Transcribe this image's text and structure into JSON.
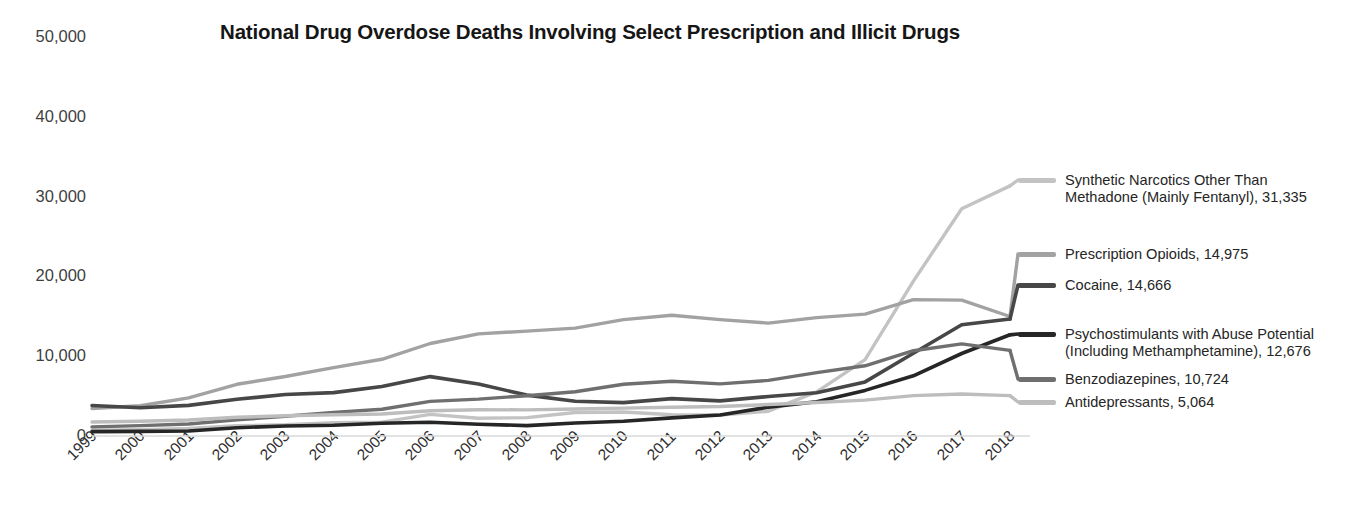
{
  "chart_data": {
    "type": "line",
    "title": "National Drug Overdose Deaths Involving Select Prescription and Illicit Drugs",
    "xlabel": "",
    "ylabel": "",
    "ylim": [
      0,
      50000
    ],
    "grid": false,
    "legend_position": "right",
    "categories": [
      "1999",
      "2000",
      "2001",
      "2002",
      "2003",
      "2004",
      "2005",
      "2006",
      "2007",
      "2008",
      "2009",
      "2010",
      "2011",
      "2012",
      "2013",
      "2014",
      "2015",
      "2016",
      "2017",
      "2018"
    ],
    "ytick_labels": [
      "50,000",
      "40,000",
      "30,000",
      "20,000",
      "10,000",
      "0"
    ],
    "ytick_values": [
      50000,
      40000,
      30000,
      20000,
      10000,
      0
    ],
    "series": [
      {
        "name": "Synthetic Narcotics Other Than Methadone (Mainly Fentanyl)",
        "legend_label": "Synthetic Narcotics Other Than\nMethadone (Mainly Fentanyl), 31,335",
        "final_value": "31,335",
        "color": "#c3c3c3",
        "width": 3.4,
        "values": [
          730,
          782,
          957,
          1295,
          1400,
          1664,
          1742,
          2707,
          2213,
          2306,
          2946,
          3007,
          2666,
          2628,
          3105,
          5544,
          9580,
          19413,
          28466,
          31335
        ]
      },
      {
        "name": "Prescription Opioids",
        "legend_label": "Prescription Opioids, 14,975",
        "final_value": "14,975",
        "color": "#a2a2a2",
        "width": 3.4,
        "values": [
          3442,
          3785,
          4770,
          6483,
          7456,
          8577,
          9612,
          11589,
          12796,
          13149,
          13523,
          14583,
          15140,
          14583,
          14145,
          14838,
          15281,
          17087,
          17029,
          14975
        ]
      },
      {
        "name": "Cocaine",
        "legend_label": "Cocaine, 14,666",
        "final_value": "14,666",
        "color": "#474747",
        "width": 3.6,
        "values": [
          3822,
          3544,
          3833,
          4599,
          5196,
          5443,
          6208,
          7448,
          6512,
          5129,
          4350,
          4183,
          4681,
          4404,
          4944,
          5415,
          6784,
          10375,
          13942,
          14666
        ]
      },
      {
        "name": "Psychostimulants with Abuse Potential (Including Methamphetamine)",
        "legend_label": "Psychostimulants with Abuse Potential\n(Including Methamphetamine), 12,676",
        "final_value": "12,676",
        "color": "#262626",
        "width": 3.6,
        "values": [
          547,
          573,
          626,
          1044,
          1250,
          1335,
          1608,
          1711,
          1476,
          1304,
          1632,
          1854,
          2266,
          2635,
          3627,
          4298,
          5716,
          7542,
          10333,
          12676
        ]
      },
      {
        "name": "Benzodiazepines",
        "legend_label": "Benzodiazepines, 10,724",
        "final_value": "10,724",
        "color": "#6f6f6f",
        "width": 3.4,
        "values": [
          1135,
          1298,
          1505,
          2021,
          2465,
          2963,
          3346,
          4342,
          4620,
          5045,
          5548,
          6497,
          6872,
          6524,
          6973,
          7945,
          8791,
          10684,
          11537,
          10724
        ]
      },
      {
        "name": "Antidepressants",
        "legend_label": "Antidepressants, 5,064",
        "final_value": "5,064",
        "color": "#bdbdbd",
        "width": 3.4,
        "values": [
          1749,
          1850,
          2003,
          2345,
          2536,
          2660,
          2762,
          3164,
          3290,
          3268,
          3385,
          3499,
          3612,
          3699,
          3942,
          4201,
          4498,
          5064,
          5269,
          5064
        ]
      }
    ]
  }
}
